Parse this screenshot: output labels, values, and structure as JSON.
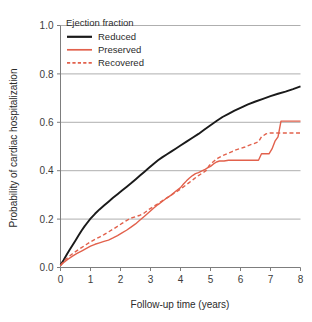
{
  "chart_data": {
    "type": "line",
    "title": "",
    "xlabel": "Follow-up time  (years)",
    "ylabel": "Probability of cardiac hospitalization",
    "xlim": [
      0,
      8
    ],
    "ylim": [
      0,
      1.0
    ],
    "xticks": [
      "0",
      "1",
      "2",
      "3",
      "4",
      "5",
      "6",
      "7",
      "8"
    ],
    "xtick_values": [
      0,
      1,
      2,
      3,
      4,
      5,
      6,
      7,
      8
    ],
    "yticks": [
      "0.0",
      "0.2",
      "0.4",
      "0.6",
      "0.8",
      "1.0"
    ],
    "ytick_values": [
      0.0,
      0.2,
      0.4,
      0.6,
      0.8,
      1.0
    ],
    "grid": "horizontal",
    "legend_position": "top-left-inside",
    "legend_title": "Ejection fraction",
    "series": [
      {
        "name": "Reduced",
        "color": "#1a1a1a",
        "style": "solid",
        "width": 1.9,
        "points": [
          [
            0.0,
            0.01
          ],
          [
            0.1,
            0.03
          ],
          [
            0.2,
            0.052
          ],
          [
            0.3,
            0.072
          ],
          [
            0.4,
            0.092
          ],
          [
            0.5,
            0.112
          ],
          [
            0.6,
            0.132
          ],
          [
            0.7,
            0.152
          ],
          [
            0.8,
            0.17
          ],
          [
            0.9,
            0.186
          ],
          [
            1.0,
            0.202
          ],
          [
            1.15,
            0.222
          ],
          [
            1.3,
            0.24
          ],
          [
            1.45,
            0.256
          ],
          [
            1.6,
            0.272
          ],
          [
            1.75,
            0.288
          ],
          [
            1.9,
            0.303
          ],
          [
            2.05,
            0.318
          ],
          [
            2.2,
            0.333
          ],
          [
            2.35,
            0.348
          ],
          [
            2.5,
            0.364
          ],
          [
            2.65,
            0.38
          ],
          [
            2.8,
            0.396
          ],
          [
            2.95,
            0.412
          ],
          [
            3.1,
            0.428
          ],
          [
            3.25,
            0.443
          ],
          [
            3.4,
            0.456
          ],
          [
            3.55,
            0.468
          ],
          [
            3.7,
            0.48
          ],
          [
            3.85,
            0.492
          ],
          [
            4.0,
            0.504
          ],
          [
            4.2,
            0.52
          ],
          [
            4.4,
            0.536
          ],
          [
            4.6,
            0.552
          ],
          [
            4.8,
            0.57
          ],
          [
            5.0,
            0.588
          ],
          [
            5.2,
            0.605
          ],
          [
            5.4,
            0.622
          ],
          [
            5.6,
            0.635
          ],
          [
            5.8,
            0.648
          ],
          [
            6.0,
            0.66
          ],
          [
            6.25,
            0.674
          ],
          [
            6.5,
            0.686
          ],
          [
            6.75,
            0.697
          ],
          [
            7.0,
            0.708
          ],
          [
            7.25,
            0.718
          ],
          [
            7.5,
            0.727
          ],
          [
            7.75,
            0.737
          ],
          [
            8.0,
            0.748
          ]
        ]
      },
      {
        "name": "Preserved",
        "color": "#e2614c",
        "style": "solid",
        "width": 1.4,
        "points": [
          [
            0.0,
            0.008
          ],
          [
            0.1,
            0.02
          ],
          [
            0.25,
            0.034
          ],
          [
            0.4,
            0.047
          ],
          [
            0.55,
            0.058
          ],
          [
            0.7,
            0.068
          ],
          [
            0.85,
            0.078
          ],
          [
            1.0,
            0.088
          ],
          [
            1.15,
            0.096
          ],
          [
            1.3,
            0.102
          ],
          [
            1.45,
            0.108
          ],
          [
            1.6,
            0.113
          ],
          [
            1.75,
            0.122
          ],
          [
            1.9,
            0.132
          ],
          [
            2.05,
            0.143
          ],
          [
            2.2,
            0.154
          ],
          [
            2.35,
            0.167
          ],
          [
            2.5,
            0.18
          ],
          [
            2.65,
            0.196
          ],
          [
            2.8,
            0.212
          ],
          [
            2.95,
            0.228
          ],
          [
            3.1,
            0.245
          ],
          [
            3.25,
            0.26
          ],
          [
            3.4,
            0.274
          ],
          [
            3.55,
            0.288
          ],
          [
            3.7,
            0.3
          ],
          [
            3.85,
            0.316
          ],
          [
            4.0,
            0.33
          ],
          [
            4.1,
            0.345
          ],
          [
            4.2,
            0.358
          ],
          [
            4.3,
            0.37
          ],
          [
            4.4,
            0.38
          ],
          [
            4.5,
            0.388
          ],
          [
            4.6,
            0.392
          ],
          [
            4.7,
            0.398
          ],
          [
            4.8,
            0.404
          ],
          [
            4.9,
            0.412
          ],
          [
            5.0,
            0.418
          ],
          [
            5.1,
            0.428
          ],
          [
            5.2,
            0.436
          ],
          [
            5.3,
            0.44
          ],
          [
            5.45,
            0.44
          ],
          [
            5.6,
            0.443
          ],
          [
            6.0,
            0.443
          ],
          [
            6.4,
            0.443
          ],
          [
            6.6,
            0.443
          ],
          [
            6.7,
            0.47
          ],
          [
            6.8,
            0.47
          ],
          [
            6.95,
            0.47
          ],
          [
            7.05,
            0.49
          ],
          [
            7.15,
            0.522
          ],
          [
            7.25,
            0.54
          ],
          [
            7.35,
            0.605
          ],
          [
            7.6,
            0.605
          ],
          [
            8.0,
            0.605
          ]
        ]
      },
      {
        "name": "Recovered",
        "color": "#e2614c",
        "style": "dashed",
        "width": 1.4,
        "points": [
          [
            0.0,
            0.008
          ],
          [
            0.1,
            0.025
          ],
          [
            0.25,
            0.042
          ],
          [
            0.4,
            0.057
          ],
          [
            0.55,
            0.07
          ],
          [
            0.7,
            0.082
          ],
          [
            0.85,
            0.094
          ],
          [
            1.0,
            0.106
          ],
          [
            1.15,
            0.116
          ],
          [
            1.3,
            0.126
          ],
          [
            1.45,
            0.136
          ],
          [
            1.6,
            0.147
          ],
          [
            1.75,
            0.158
          ],
          [
            1.9,
            0.17
          ],
          [
            2.05,
            0.182
          ],
          [
            2.2,
            0.194
          ],
          [
            2.35,
            0.204
          ],
          [
            2.5,
            0.21
          ],
          [
            2.65,
            0.216
          ],
          [
            2.8,
            0.226
          ],
          [
            2.95,
            0.24
          ],
          [
            3.1,
            0.252
          ],
          [
            3.25,
            0.264
          ],
          [
            3.4,
            0.276
          ],
          [
            3.55,
            0.288
          ],
          [
            3.7,
            0.3
          ],
          [
            3.85,
            0.312
          ],
          [
            4.0,
            0.324
          ],
          [
            4.15,
            0.338
          ],
          [
            4.3,
            0.352
          ],
          [
            4.45,
            0.366
          ],
          [
            4.6,
            0.38
          ],
          [
            4.75,
            0.392
          ],
          [
            4.85,
            0.4
          ],
          [
            4.95,
            0.42
          ],
          [
            5.1,
            0.438
          ],
          [
            5.25,
            0.452
          ],
          [
            5.4,
            0.462
          ],
          [
            5.55,
            0.47
          ],
          [
            5.7,
            0.478
          ],
          [
            5.85,
            0.486
          ],
          [
            6.0,
            0.492
          ],
          [
            6.15,
            0.498
          ],
          [
            6.3,
            0.506
          ],
          [
            6.45,
            0.512
          ],
          [
            6.6,
            0.52
          ],
          [
            6.7,
            0.54
          ],
          [
            6.85,
            0.552
          ],
          [
            7.0,
            0.556
          ],
          [
            7.3,
            0.556
          ],
          [
            7.6,
            0.556
          ],
          [
            8.0,
            0.556
          ]
        ]
      }
    ]
  },
  "legend": {
    "title": "Ejection fraction",
    "items": [
      {
        "label": "Reduced"
      },
      {
        "label": "Preserved"
      },
      {
        "label": "Recovered"
      }
    ]
  },
  "axes": {
    "x_label": "Follow-up time  (years)",
    "y_label": "Probability of cardiac hospitalization"
  },
  "colors": {
    "reduced": "#1a1a1a",
    "preserved": "#e2614c",
    "recovered": "#e2614c",
    "grid": "#9a9a9a",
    "axis": "#7d7d7d",
    "text": "#2b2b2b"
  }
}
